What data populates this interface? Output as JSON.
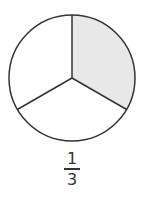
{
  "diagram": {
    "type": "fraction-circle",
    "parts": 3,
    "shaded_parts": 1,
    "shade_color": "#e8e8e8",
    "stroke_color": "#333333"
  },
  "fraction": {
    "numerator": "1",
    "denominator": "3"
  }
}
